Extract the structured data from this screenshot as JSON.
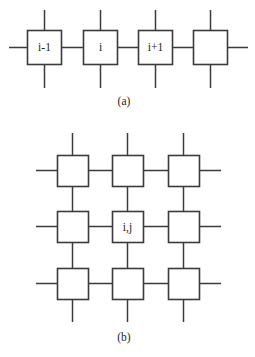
{
  "figure": {
    "background_color": "#ffffff",
    "line_color": "#3b3b3d",
    "text_color": "#231f20",
    "panels": [
      {
        "id": "panel-a",
        "caption": "(a)",
        "type": "1d-chain",
        "node_labels": [
          "i-1",
          "i",
          "i+1",
          ""
        ]
      },
      {
        "id": "panel-b",
        "caption": "(b)",
        "type": "2d-lattice",
        "grid": [
          [
            "",
            "",
            ""
          ],
          [
            "",
            "i,j",
            ""
          ],
          [
            "",
            "",
            ""
          ]
        ]
      }
    ]
  },
  "chain": {
    "node_1_label": "i-1",
    "node_2_label": "i",
    "node_3_label": "i+1",
    "node_4_label": ""
  },
  "lattice": {
    "center_label": "i,j"
  },
  "captions": {
    "panel_a": "(a)",
    "panel_b": "(b)"
  }
}
